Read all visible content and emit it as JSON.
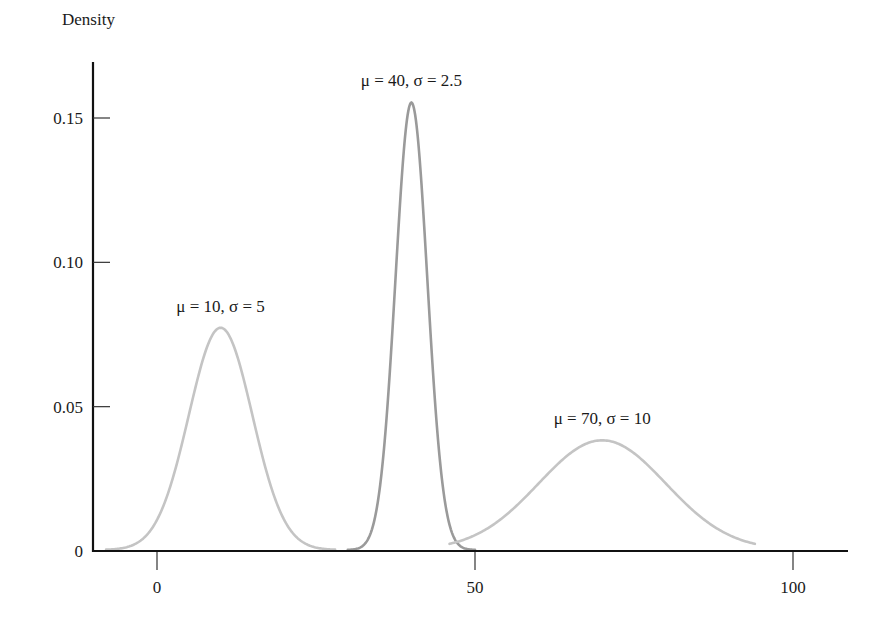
{
  "chart_data": {
    "type": "line",
    "title": "",
    "xlabel": "",
    "ylabel": "Density",
    "xlim": [
      -10,
      108
    ],
    "ylim": [
      0,
      0.17
    ],
    "grid": false,
    "legend": "none (inline annotations)",
    "x_ticks": [
      {
        "value": 0,
        "label": "0"
      },
      {
        "value": 50,
        "label": "50"
      },
      {
        "value": 100,
        "label": "100"
      }
    ],
    "y_ticks": [
      {
        "value": 0,
        "label": "0"
      },
      {
        "value": 0.05,
        "label": "0.05"
      },
      {
        "value": 0.1,
        "label": "0.10"
      },
      {
        "value": 0.15,
        "label": "0.15"
      }
    ],
    "series": [
      {
        "name": "μ = 10, σ = 5",
        "mu": 10,
        "sigma": 5,
        "x_range": [
          -8,
          28
        ],
        "peak_density": 0.077,
        "color": "#c4c4c4",
        "label_pos": {
          "x": 10,
          "y": 0.085
        }
      },
      {
        "name": "μ = 40, σ = 2.5",
        "mu": 40,
        "sigma": 2.5,
        "x_range": [
          30,
          50
        ],
        "peak_density": 0.155,
        "color": "#9a9a9a",
        "label_pos": {
          "x": 40,
          "y": 0.163
        }
      },
      {
        "name": "μ = 70, σ = 10",
        "mu": 70,
        "sigma": 10,
        "x_range": [
          46,
          94
        ],
        "peak_density": 0.038,
        "color": "#c4c4c4",
        "label_pos": {
          "x": 70,
          "y": 0.046
        }
      }
    ]
  },
  "axes": {
    "y_title": "Density"
  }
}
